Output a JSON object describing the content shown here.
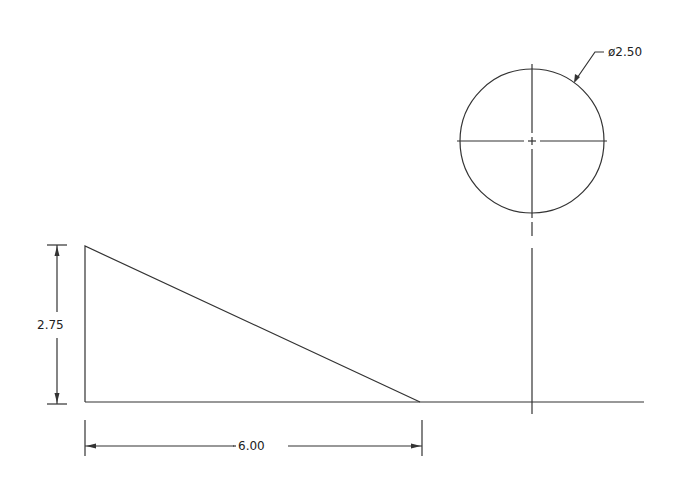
{
  "drawing": {
    "dimensions": {
      "height": "2.75",
      "width": "6.00",
      "diameter": "ø2.50"
    },
    "colors": {
      "line": "#333333",
      "background": "#ffffff"
    }
  }
}
